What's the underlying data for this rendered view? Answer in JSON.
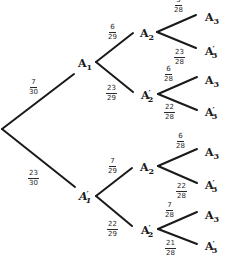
{
  "diagram": {
    "type": "probability-tree",
    "line_color": "#1a1a1a",
    "root": {
      "label": ""
    },
    "level1": [
      {
        "label": "A",
        "sub": "1",
        "prime": false,
        "prob_num": "7",
        "prob_den": "30"
      },
      {
        "label": "A",
        "sub": "1",
        "prime": true,
        "prob_num": "23",
        "prob_den": "30"
      }
    ],
    "level2": [
      {
        "parent": 0,
        "label": "A",
        "sub": "2",
        "prime": false,
        "prob_num": "6",
        "prob_den": "29"
      },
      {
        "parent": 0,
        "label": "A",
        "sub": "2",
        "prime": true,
        "prob_num": "23",
        "prob_den": "29"
      },
      {
        "parent": 1,
        "label": "A",
        "sub": "2",
        "prime": false,
        "prob_num": "7",
        "prob_den": "29"
      },
      {
        "parent": 1,
        "label": "A",
        "sub": "2",
        "prime": true,
        "prob_num": "22",
        "prob_den": "29"
      }
    ],
    "level3": [
      {
        "parent": 0,
        "label": "A",
        "sub": "3",
        "prime": false,
        "prob_num": "5",
        "prob_den": "28"
      },
      {
        "parent": 0,
        "label": "A",
        "sub": "3",
        "prime": true,
        "prob_num": "23",
        "prob_den": "28"
      },
      {
        "parent": 1,
        "label": "A",
        "sub": "3",
        "prime": false,
        "prob_num": "6",
        "prob_den": "28"
      },
      {
        "parent": 1,
        "label": "A",
        "sub": "3",
        "prime": true,
        "prob_num": "22",
        "prob_den": "28"
      },
      {
        "parent": 2,
        "label": "A",
        "sub": "3",
        "prime": false,
        "prob_num": "6",
        "prob_den": "28"
      },
      {
        "parent": 2,
        "label": "A",
        "sub": "3",
        "prime": true,
        "prob_num": "22",
        "prob_den": "28"
      },
      {
        "parent": 3,
        "label": "A",
        "sub": "3",
        "prime": false,
        "prob_num": "7",
        "prob_den": "28"
      },
      {
        "parent": 3,
        "label": "A",
        "sub": "3",
        "prime": true,
        "prob_num": "21",
        "prob_den": "28"
      }
    ],
    "prime_symbol": "′"
  }
}
